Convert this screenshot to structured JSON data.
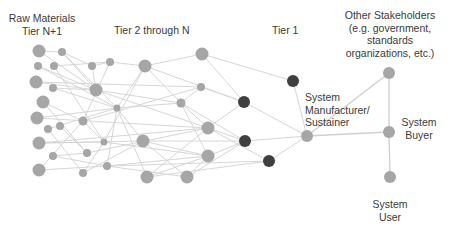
{
  "labels": {
    "raw_materials": [
      "Raw Materials",
      "Tier N+1"
    ],
    "tier2": "Tier 2 through N",
    "tier1": "Tier 1",
    "manufacturer": [
      "System",
      "Manufacturer/",
      "Sustainer"
    ],
    "other_stakeholders": [
      "Other Stakeholders",
      "(e.g. government,",
      "standards",
      "organizations, etc.)"
    ],
    "buyer": [
      "System",
      "Buyer"
    ],
    "user": [
      "System",
      "User"
    ]
  },
  "colors": {
    "node_gray": "#a6a6a6",
    "node_dark": "#3f3f3f",
    "edge": "#d6d6d6",
    "stake_edge": "#cfcfcf",
    "text": "#3a3a3a"
  },
  "nodes": [
    {
      "id": "a1",
      "x": 39,
      "y": 51,
      "r": 6.5,
      "c": "gray"
    },
    {
      "id": "a2",
      "x": 62,
      "y": 52,
      "r": 4,
      "c": "gray"
    },
    {
      "id": "a3",
      "x": 38,
      "y": 66,
      "r": 4,
      "c": "gray"
    },
    {
      "id": "a4",
      "x": 54,
      "y": 66,
      "r": 4,
      "c": "gray"
    },
    {
      "id": "a5",
      "x": 92,
      "y": 66,
      "r": 4,
      "c": "gray"
    },
    {
      "id": "a6",
      "x": 110,
      "y": 62,
      "r": 4,
      "c": "gray"
    },
    {
      "id": "a7",
      "x": 36,
      "y": 82,
      "r": 6.5,
      "c": "gray"
    },
    {
      "id": "a8",
      "x": 53,
      "y": 88,
      "r": 4,
      "c": "gray"
    },
    {
      "id": "a9",
      "x": 96,
      "y": 90,
      "r": 6.5,
      "c": "gray"
    },
    {
      "id": "a10",
      "x": 43,
      "y": 102,
      "r": 6.5,
      "c": "gray"
    },
    {
      "id": "a11",
      "x": 117,
      "y": 108,
      "r": 3.5,
      "c": "gray"
    },
    {
      "id": "a12",
      "x": 37,
      "y": 118,
      "r": 6.5,
      "c": "gray"
    },
    {
      "id": "a13",
      "x": 83,
      "y": 121,
      "r": 4.5,
      "c": "gray"
    },
    {
      "id": "a14",
      "x": 48,
      "y": 129,
      "r": 4,
      "c": "gray"
    },
    {
      "id": "a15",
      "x": 60,
      "y": 126,
      "r": 4,
      "c": "gray"
    },
    {
      "id": "a16",
      "x": 39,
      "y": 143,
      "r": 6.5,
      "c": "gray"
    },
    {
      "id": "a17",
      "x": 104,
      "y": 142,
      "r": 3.5,
      "c": "gray"
    },
    {
      "id": "a18",
      "x": 53,
      "y": 156,
      "r": 4,
      "c": "gray"
    },
    {
      "id": "a19",
      "x": 87,
      "y": 153,
      "r": 4,
      "c": "gray"
    },
    {
      "id": "a20",
      "x": 39,
      "y": 170,
      "r": 6.5,
      "c": "gray"
    },
    {
      "id": "a21",
      "x": 83,
      "y": 173,
      "r": 4,
      "c": "gray"
    },
    {
      "id": "a22",
      "x": 107,
      "y": 166,
      "r": 4,
      "c": "gray"
    },
    {
      "id": "b1",
      "x": 145,
      "y": 66,
      "r": 6.5,
      "c": "gray"
    },
    {
      "id": "b2",
      "x": 202,
      "y": 54,
      "r": 6.5,
      "c": "gray"
    },
    {
      "id": "b3",
      "x": 201,
      "y": 87,
      "r": 4,
      "c": "gray"
    },
    {
      "id": "b4",
      "x": 181,
      "y": 103,
      "r": 4.5,
      "c": "gray"
    },
    {
      "id": "b5",
      "x": 208,
      "y": 128,
      "r": 6.5,
      "c": "gray"
    },
    {
      "id": "b6",
      "x": 143,
      "y": 141,
      "r": 6.5,
      "c": "gray"
    },
    {
      "id": "b7",
      "x": 208,
      "y": 156,
      "r": 6.5,
      "c": "gray"
    },
    {
      "id": "b8",
      "x": 147,
      "y": 177,
      "r": 6.5,
      "c": "gray"
    },
    {
      "id": "b9",
      "x": 187,
      "y": 177,
      "r": 6.5,
      "c": "gray"
    },
    {
      "id": "t1",
      "x": 293,
      "y": 81,
      "r": 6,
      "c": "dark"
    },
    {
      "id": "t2",
      "x": 244,
      "y": 102,
      "r": 6,
      "c": "dark"
    },
    {
      "id": "t3",
      "x": 245,
      "y": 141,
      "r": 6,
      "c": "dark"
    },
    {
      "id": "t4",
      "x": 269,
      "y": 161,
      "r": 6,
      "c": "dark"
    },
    {
      "id": "m",
      "x": 307,
      "y": 136,
      "r": 6,
      "c": "gray"
    },
    {
      "id": "s",
      "x": 389,
      "y": 73,
      "r": 6,
      "c": "gray"
    },
    {
      "id": "buy",
      "x": 389,
      "y": 132,
      "r": 6,
      "c": "gray"
    },
    {
      "id": "u",
      "x": 390,
      "y": 177,
      "r": 6,
      "c": "gray"
    }
  ],
  "edges": [
    [
      "a1",
      "a9"
    ],
    [
      "a1",
      "a2"
    ],
    [
      "a2",
      "a5"
    ],
    [
      "a2",
      "a9"
    ],
    [
      "a2",
      "a11"
    ],
    [
      "a3",
      "a9"
    ],
    [
      "a4",
      "a6"
    ],
    [
      "a4",
      "a17"
    ],
    [
      "a5",
      "a6"
    ],
    [
      "a5",
      "a9"
    ],
    [
      "a6",
      "b1"
    ],
    [
      "a6",
      "a13"
    ],
    [
      "a7",
      "a9"
    ],
    [
      "a7",
      "b3"
    ],
    [
      "a8",
      "a9"
    ],
    [
      "a8",
      "a11"
    ],
    [
      "a9",
      "b4"
    ],
    [
      "a9",
      "b5"
    ],
    [
      "a10",
      "a13"
    ],
    [
      "a10",
      "a19"
    ],
    [
      "a11",
      "b1"
    ],
    [
      "a11",
      "b4"
    ],
    [
      "a11",
      "b6"
    ],
    [
      "a11",
      "b8"
    ],
    [
      "a11",
      "a22"
    ],
    [
      "a12",
      "a11"
    ],
    [
      "a12",
      "b5"
    ],
    [
      "a13",
      "a17"
    ],
    [
      "a13",
      "b3"
    ],
    [
      "a14",
      "a21"
    ],
    [
      "a14",
      "a11"
    ],
    [
      "a15",
      "a19"
    ],
    [
      "a16",
      "a17"
    ],
    [
      "a16",
      "b6"
    ],
    [
      "a17",
      "b7"
    ],
    [
      "a17",
      "a21"
    ],
    [
      "a18",
      "a19"
    ],
    [
      "a18",
      "a22"
    ],
    [
      "a19",
      "b5"
    ],
    [
      "a20",
      "a13"
    ],
    [
      "a20",
      "a22"
    ],
    [
      "a21",
      "b6"
    ],
    [
      "a22",
      "b9"
    ],
    [
      "a22",
      "b7"
    ],
    [
      "a16",
      "b5"
    ],
    [
      "a3",
      "a11"
    ],
    [
      "b1",
      "b2"
    ],
    [
      "b1",
      "b4"
    ],
    [
      "b1",
      "t2"
    ],
    [
      "b1",
      "a17"
    ],
    [
      "b2",
      "t1"
    ],
    [
      "b2",
      "t2"
    ],
    [
      "b3",
      "b4"
    ],
    [
      "b3",
      "t2"
    ],
    [
      "b4",
      "b7"
    ],
    [
      "b4",
      "t3"
    ],
    [
      "b4",
      "b5"
    ],
    [
      "b5",
      "t2"
    ],
    [
      "b5",
      "t3"
    ],
    [
      "b5",
      "b8"
    ],
    [
      "b5",
      "t4"
    ],
    [
      "b6",
      "b7"
    ],
    [
      "b6",
      "t3"
    ],
    [
      "b6",
      "b9"
    ],
    [
      "b7",
      "t3"
    ],
    [
      "b7",
      "b9"
    ],
    [
      "b8",
      "t4"
    ],
    [
      "b8",
      "b7"
    ],
    [
      "b9",
      "t3"
    ],
    [
      "a22",
      "t4"
    ],
    [
      "t1",
      "m"
    ],
    [
      "t2",
      "m"
    ],
    [
      "t3",
      "m"
    ],
    [
      "t4",
      "m"
    ]
  ],
  "stake_edges": [
    [
      "m",
      "s"
    ],
    [
      "m",
      "buy"
    ],
    [
      "s",
      "buy"
    ],
    [
      "buy",
      "u"
    ]
  ]
}
